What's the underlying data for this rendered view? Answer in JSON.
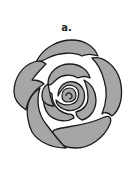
{
  "figure": {
    "label": "a.",
    "colors": {
      "petal_fill": "#a6a6a6",
      "outline": "#1a1a1a",
      "background": "#ffffff"
    }
  }
}
